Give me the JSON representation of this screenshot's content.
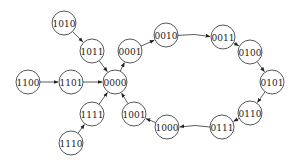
{
  "diagram": {
    "type": "state-transition-graph",
    "nodes": [
      {
        "id": "1010",
        "label": "1010",
        "x": 64,
        "y": 23
      },
      {
        "id": "1011",
        "label": "1011",
        "x": 92,
        "y": 51
      },
      {
        "id": "0001",
        "label": "0001",
        "x": 130,
        "y": 51
      },
      {
        "id": "0010",
        "label": "0010",
        "x": 166,
        "y": 35
      },
      {
        "id": "0011",
        "label": "0011",
        "x": 223,
        "y": 37
      },
      {
        "id": "0100",
        "label": "0100",
        "x": 250,
        "y": 52
      },
      {
        "id": "0101",
        "label": "0101",
        "x": 272,
        "y": 82
      },
      {
        "id": "0110",
        "label": "0110",
        "x": 250,
        "y": 113
      },
      {
        "id": "0111",
        "label": "0111",
        "x": 222,
        "y": 127
      },
      {
        "id": "1000",
        "label": "1000",
        "x": 167,
        "y": 127
      },
      {
        "id": "1001",
        "label": "1001",
        "x": 134,
        "y": 114
      },
      {
        "id": "0000",
        "label": "0000",
        "x": 115,
        "y": 82
      },
      {
        "id": "1100",
        "label": "1100",
        "x": 28,
        "y": 82
      },
      {
        "id": "1101",
        "label": "1101",
        "x": 71,
        "y": 82
      },
      {
        "id": "1111",
        "label": "1111",
        "x": 92,
        "y": 114
      },
      {
        "id": "1110",
        "label": "1110",
        "x": 71,
        "y": 143
      }
    ],
    "edges": [
      {
        "from": "1010",
        "to": "1011"
      },
      {
        "from": "1011",
        "to": "0000"
      },
      {
        "from": "1100",
        "to": "1101"
      },
      {
        "from": "1101",
        "to": "0000"
      },
      {
        "from": "1110",
        "to": "1111"
      },
      {
        "from": "1111",
        "to": "0000"
      },
      {
        "from": "0000",
        "to": "0001"
      },
      {
        "from": "0001",
        "to": "0010"
      },
      {
        "from": "0010",
        "to": "0011"
      },
      {
        "from": "0011",
        "to": "0100"
      },
      {
        "from": "0100",
        "to": "0101"
      },
      {
        "from": "0101",
        "to": "0110"
      },
      {
        "from": "0110",
        "to": "0111"
      },
      {
        "from": "0111",
        "to": "1000"
      },
      {
        "from": "1000",
        "to": "1001"
      },
      {
        "from": "1001",
        "to": "0000"
      }
    ],
    "node_radius": 12
  }
}
